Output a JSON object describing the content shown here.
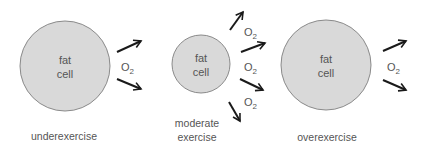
{
  "colors": {
    "cell_fill": "#d9d9d9",
    "cell_stroke": "#8a8a8a",
    "text": "#555555",
    "arrow": "#1a1a1a"
  },
  "panels": [
    {
      "id": "underexercise",
      "cell": {
        "label_line1": "fat",
        "label_line2": "cell",
        "cx": 65,
        "cy": 66,
        "r": 45
      },
      "caption_lines": [
        "underexercise"
      ],
      "o2_labels": [
        {
          "text": "O",
          "sub": "2"
        }
      ]
    },
    {
      "id": "moderate",
      "cell": {
        "label_line1": "fat",
        "label_line2": "cell",
        "cx": 201,
        "cy": 64,
        "r": 29
      },
      "caption_lines": [
        "moderate",
        "exercise"
      ],
      "o2_labels": [
        {
          "text": "O",
          "sub": "2"
        },
        {
          "text": "O",
          "sub": "2"
        },
        {
          "text": "O",
          "sub": "2"
        }
      ]
    },
    {
      "id": "overexercise",
      "cell": {
        "label_line1": "fat",
        "label_line2": "cell",
        "cx": 326,
        "cy": 65,
        "r": 45
      },
      "caption_lines": [
        "overexercise"
      ],
      "o2_labels": [
        {
          "text": "O",
          "sub": "2"
        }
      ]
    }
  ]
}
